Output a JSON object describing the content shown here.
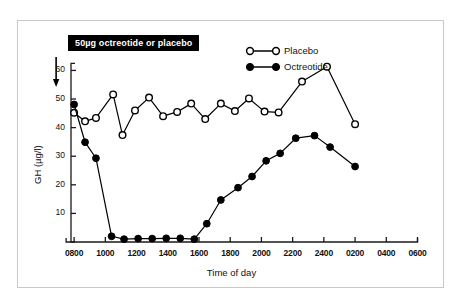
{
  "figure": {
    "border_color": "#c9c9c9",
    "background": "#ffffff"
  },
  "annotation": {
    "text": "50µg octreotide or placebo",
    "box_fill": "#000000",
    "text_color": "#ffffff",
    "arrow_label": "dose-arrow"
  },
  "legend": {
    "position": "top-right-inside",
    "entries": [
      {
        "label": "Placebo",
        "marker": "open-circle",
        "color": "#000000"
      },
      {
        "label": "Octreotide",
        "marker": "filled-circle",
        "color": "#000000"
      }
    ]
  },
  "axes": {
    "y_title": "GH (µg/l)",
    "x_title": "Time of day",
    "y_ticks": [
      10,
      20,
      30,
      40,
      50,
      60
    ],
    "y_tick_labels": [
      "10",
      "20",
      "30",
      "40",
      "50",
      "60"
    ],
    "x_tick_labels": [
      "0800",
      "1000",
      "1200",
      "1400",
      "1600",
      "1800",
      "2000",
      "2200",
      "2400",
      "0200",
      "0400",
      "0600"
    ]
  },
  "chart_data": {
    "type": "line",
    "title": "",
    "subtitle": "",
    "xlabel": "Time of day",
    "ylabel": "GH (µg/l)",
    "xlim": [
      0,
      23
    ],
    "ylim": [
      0,
      64
    ],
    "grid": false,
    "legend_position": "top-right",
    "annotations": [
      {
        "text": "50µg octreotide or placebo",
        "x": 0.2,
        "y": 62,
        "arrow_to_x": 0.2,
        "arrow_to_y": 52
      }
    ],
    "x_tick_positions": [
      0,
      2,
      4,
      6,
      8,
      10,
      12,
      14,
      16,
      18,
      20,
      22
    ],
    "x_tick_labels": [
      "0800",
      "1000",
      "1200",
      "1400",
      "1600",
      "1800",
      "2000",
      "2200",
      "2400",
      "0200",
      "0400",
      "0600"
    ],
    "y_tick_positions": [
      10,
      20,
      30,
      40,
      50,
      60
    ],
    "series": [
      {
        "name": "Placebo",
        "marker": "open-circle",
        "color": "#000000",
        "x": [
          0.2,
          0.9,
          1.6,
          2.7,
          3.3,
          4.1,
          5.0,
          5.9,
          6.8,
          7.7,
          8.6,
          9.6,
          10.5,
          11.4,
          12.4,
          13.3,
          14.2,
          15.2,
          16.1,
          18.0,
          20.0,
          22.0
        ],
        "values": [
          45.2,
          42.2,
          43.4,
          51.6,
          37.4,
          46.0,
          50.5,
          44.0,
          45.5,
          48.4,
          43.0,
          48.4,
          45.8,
          50.2,
          45.6,
          45.3,
          50.2,
          56.1,
          61.3,
          41.2,
          41.2,
          41.2
        ]
      },
      {
        "name": "Octreotide",
        "marker": "filled-circle",
        "color": "#000000",
        "x": [
          0.2,
          0.9,
          1.6,
          2.4,
          3.2,
          4.1,
          5.0,
          5.9,
          6.8,
          7.7,
          8.3,
          9.0,
          9.9,
          10.8,
          11.7,
          12.6,
          13.5,
          14.4,
          15.3,
          16.2,
          18.0,
          20.0,
          22.0
        ],
        "values": [
          48.1,
          34.9,
          29.3,
          2.0,
          1.0,
          1.2,
          1.2,
          1.3,
          1.3,
          1.0,
          6.4,
          14.7,
          19.0,
          22.9,
          28.4,
          31.0,
          36.3,
          37.2,
          33.2,
          26.4,
          0,
          0,
          0
        ]
      }
    ],
    "series_plotted": [
      {
        "name": "Placebo",
        "points": [
          [
            0.2,
            45.2
          ],
          [
            0.9,
            42.2
          ],
          [
            1.6,
            43.4
          ],
          [
            2.7,
            51.6
          ],
          [
            3.3,
            37.4
          ],
          [
            4.1,
            46.0
          ],
          [
            5.0,
            50.5
          ],
          [
            5.9,
            44.0
          ],
          [
            6.8,
            45.5
          ],
          [
            7.7,
            48.4
          ],
          [
            8.6,
            43.0
          ],
          [
            9.6,
            48.4
          ],
          [
            10.5,
            45.8
          ],
          [
            11.4,
            50.2
          ],
          [
            12.4,
            45.6
          ],
          [
            13.3,
            45.3
          ],
          [
            14.8,
            56.1
          ],
          [
            16.4,
            61.3
          ],
          [
            18.2,
            41.2
          ]
        ]
      },
      {
        "name": "Octreotide",
        "points": [
          [
            0.2,
            48.1
          ],
          [
            0.9,
            34.9
          ],
          [
            1.6,
            29.3
          ],
          [
            2.6,
            2.0
          ],
          [
            3.4,
            1.0
          ],
          [
            4.3,
            1.2
          ],
          [
            5.2,
            1.2
          ],
          [
            6.1,
            1.3
          ],
          [
            7.0,
            1.3
          ],
          [
            7.9,
            1.0
          ],
          [
            8.7,
            6.4
          ],
          [
            9.6,
            14.7
          ],
          [
            10.7,
            19.0
          ],
          [
            11.6,
            22.9
          ],
          [
            12.5,
            28.4
          ],
          [
            13.4,
            31.0
          ],
          [
            14.4,
            36.3
          ],
          [
            15.6,
            37.2
          ],
          [
            16.6,
            33.2
          ],
          [
            18.2,
            26.4
          ]
        ]
      }
    ]
  }
}
